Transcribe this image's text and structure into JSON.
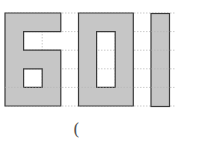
{
  "figure": {
    "digits": [
      "6",
      "0",
      "1"
    ],
    "grid": {
      "origin_x": 5,
      "origin_y": 13,
      "cell": 18.6,
      "rows": 5,
      "dash_right_x": 175
    },
    "colors": {
      "fill": "#c6c6c6",
      "border": "#3a3a3a",
      "grid_line": "#a9a9a9",
      "background": "#ffffff"
    }
  },
  "answer_blank": {
    "open_paren": "("
  }
}
